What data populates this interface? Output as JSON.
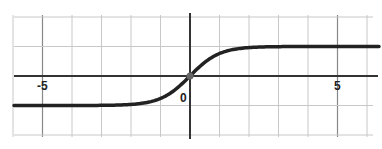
{
  "chart_data": {
    "type": "line",
    "title": "",
    "xlabel": "",
    "ylabel": "",
    "xlim": [
      -6,
      6.2
    ],
    "ylim": [
      -2,
      2
    ],
    "grid": true,
    "grid_step": 1,
    "tick_labels": {
      "x": [
        {
          "value": -5,
          "label": "-5"
        },
        {
          "value": 0,
          "label": "0"
        },
        {
          "value": 5,
          "label": "5"
        }
      ]
    },
    "series": [
      {
        "name": "sigmoid (tanh-like) curve",
        "function": "y = tanh(x)",
        "color": "#222222",
        "x": [
          -6,
          -5,
          -4,
          -3,
          -2,
          -1.5,
          -1,
          -0.5,
          0,
          0.5,
          1,
          1.5,
          2,
          3,
          4,
          5,
          6.2
        ],
        "values": [
          -1,
          -1,
          -1,
          -1,
          -0.96,
          -0.9,
          -0.76,
          -0.46,
          0,
          0.46,
          0.76,
          0.9,
          0.96,
          1,
          1,
          1,
          1
        ]
      }
    ],
    "annotations": [
      {
        "type": "point",
        "x": 0,
        "y": 0,
        "label": "origin marker"
      }
    ]
  },
  "labels": {
    "x_neg5": "-5",
    "x_0": "0",
    "x_5": "5"
  }
}
